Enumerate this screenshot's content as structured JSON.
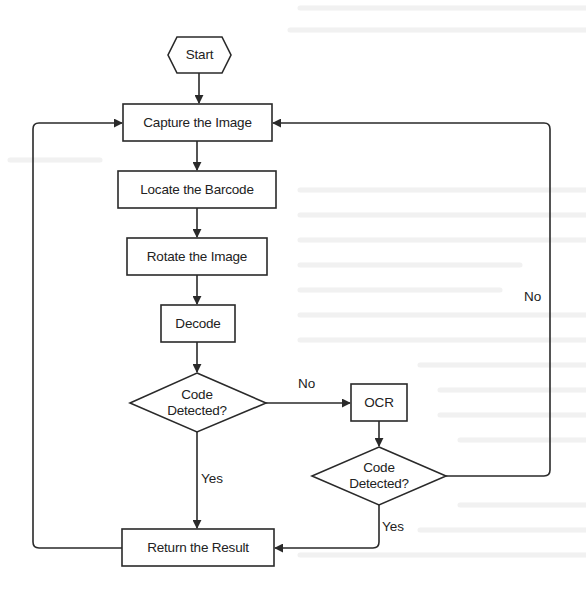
{
  "diagram": {
    "type": "flowchart",
    "colors": {
      "stroke": "#2a2a2a",
      "fill": "#ffffff",
      "text": "#222222",
      "background": "#ffffff"
    },
    "nodes": {
      "start": {
        "label": "Start",
        "shape": "hexagon"
      },
      "capture": {
        "label": "Capture the Image",
        "shape": "rectangle"
      },
      "locate": {
        "label": "Locate the Barcode",
        "shape": "rectangle"
      },
      "rotate": {
        "label": "Rotate the Image",
        "shape": "rectangle"
      },
      "decode": {
        "label": "Decode",
        "shape": "rectangle"
      },
      "decision1": {
        "label_line1": "Code",
        "label_line2": "Detected?",
        "shape": "diamond"
      },
      "ocr": {
        "label": "OCR",
        "shape": "rectangle"
      },
      "decision2": {
        "label_line1": "Code",
        "label_line2": "Detected?",
        "shape": "diamond"
      },
      "result": {
        "label": "Return the Result",
        "shape": "rectangle"
      }
    },
    "edges": [
      {
        "from": "start",
        "to": "capture",
        "label": ""
      },
      {
        "from": "capture",
        "to": "locate",
        "label": ""
      },
      {
        "from": "locate",
        "to": "rotate",
        "label": ""
      },
      {
        "from": "rotate",
        "to": "decode",
        "label": ""
      },
      {
        "from": "decode",
        "to": "decision1",
        "label": ""
      },
      {
        "from": "decision1",
        "to": "ocr",
        "label": "No"
      },
      {
        "from": "decision1",
        "to": "result",
        "label": "Yes"
      },
      {
        "from": "ocr",
        "to": "decision2",
        "label": ""
      },
      {
        "from": "decision2",
        "to": "result",
        "label": "Yes"
      },
      {
        "from": "decision2",
        "to": "capture",
        "label": "No"
      },
      {
        "from": "result",
        "to": "capture",
        "label": ""
      }
    ],
    "edge_labels": {
      "d1_no": "No",
      "d1_yes": "Yes",
      "d2_yes": "Yes",
      "d2_no": "No"
    }
  }
}
